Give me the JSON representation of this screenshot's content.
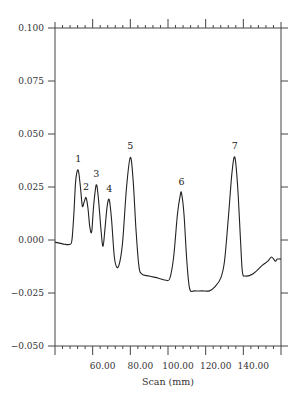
{
  "chart_data": {
    "type": "line",
    "title": "",
    "xlabel": "Scan (mm)",
    "ylabel": "",
    "xlim": [
      40,
      160
    ],
    "ylim": [
      -0.05,
      0.1
    ],
    "grid": false,
    "legend": "none",
    "x_ticks": [
      60,
      80,
      100,
      120,
      140
    ],
    "x_tick_labels": [
      "60.00",
      "80.00",
      "100.00",
      "120.00",
      "140.00"
    ],
    "x_minor_step": 4,
    "y_ticks": [
      0.1,
      0.075,
      0.05,
      0.025,
      0.0,
      -0.025,
      -0.05
    ],
    "y_tick_labels": [
      "0.100",
      "0.075",
      "0.050",
      "0.025",
      "0.000",
      "−0.025",
      "−0.050"
    ],
    "series": [
      {
        "name": "scan",
        "color": "#222222",
        "points": [
          [
            40,
            -0.001
          ],
          [
            45,
            -0.002
          ],
          [
            48,
            -0.002
          ],
          [
            49,
            0.0
          ],
          [
            50,
            0.012
          ],
          [
            51,
            0.028
          ],
          [
            52.3,
            0.033
          ],
          [
            53.5,
            0.025
          ],
          [
            54.5,
            0.016
          ],
          [
            55.5,
            0.018
          ],
          [
            56.5,
            0.02
          ],
          [
            57.5,
            0.015
          ],
          [
            58.5,
            0.006
          ],
          [
            59.5,
            0.004
          ],
          [
            60.5,
            0.016
          ],
          [
            61.9,
            0.026
          ],
          [
            63,
            0.02
          ],
          [
            64.5,
            0.004
          ],
          [
            65.5,
            -0.003
          ],
          [
            66.5,
            0.005
          ],
          [
            67.7,
            0.016
          ],
          [
            68.8,
            0.019
          ],
          [
            70,
            0.01
          ],
          [
            71.5,
            -0.008
          ],
          [
            73,
            -0.013
          ],
          [
            74.5,
            -0.01
          ],
          [
            76,
            0.0
          ],
          [
            78,
            0.025
          ],
          [
            80,
            0.039
          ],
          [
            81.5,
            0.028
          ],
          [
            83,
            0.005
          ],
          [
            84.5,
            -0.012
          ],
          [
            86,
            -0.016
          ],
          [
            90,
            -0.017
          ],
          [
            95,
            -0.018
          ],
          [
            99,
            -0.019
          ],
          [
            101,
            -0.018
          ],
          [
            103,
            -0.008
          ],
          [
            105,
            0.012
          ],
          [
            106.5,
            0.021
          ],
          [
            107.2,
            0.022
          ],
          [
            108.5,
            0.012
          ],
          [
            110,
            -0.01
          ],
          [
            111.5,
            -0.023
          ],
          [
            114,
            -0.024
          ],
          [
            118,
            -0.024
          ],
          [
            122,
            -0.024
          ],
          [
            125,
            -0.022
          ],
          [
            128,
            -0.018
          ],
          [
            130,
            -0.01
          ],
          [
            132,
            0.01
          ],
          [
            134,
            0.032
          ],
          [
            135.5,
            0.039
          ],
          [
            137,
            0.025
          ],
          [
            138.5,
            0.0
          ],
          [
            139.5,
            -0.015
          ],
          [
            141,
            -0.017
          ],
          [
            145,
            -0.016
          ],
          [
            150,
            -0.012
          ],
          [
            153,
            -0.01
          ],
          [
            155,
            -0.008
          ],
          [
            157,
            -0.01
          ],
          [
            158,
            -0.009
          ],
          [
            160,
            -0.009
          ]
        ]
      }
    ],
    "annotations": [
      {
        "text": "1",
        "x": 52.3,
        "y": 0.033
      },
      {
        "text": "2",
        "x": 56.5,
        "y": 0.02
      },
      {
        "text": "3",
        "x": 61.9,
        "y": 0.026
      },
      {
        "text": "4",
        "x": 68.8,
        "y": 0.019
      },
      {
        "text": "5",
        "x": 80.0,
        "y": 0.039
      },
      {
        "text": "6",
        "x": 107.2,
        "y": 0.022
      },
      {
        "text": "7",
        "x": 135.5,
        "y": 0.039
      }
    ]
  }
}
